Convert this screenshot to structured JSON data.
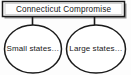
{
  "diagram": {
    "type": "concept-map",
    "background_color": "#fdfdfd",
    "stroke_color": "#1a1a1a",
    "shadow_color": "#9a9a9a",
    "fill_color": "#ffffff",
    "root": {
      "shape": "rectangle",
      "label": "Connecticut Compromise"
    },
    "children": [
      {
        "shape": "ellipse",
        "label": "Small states…",
        "position": "left"
      },
      {
        "shape": "ellipse",
        "label": "Large states…",
        "position": "right"
      }
    ],
    "connectors": [
      {
        "from": "root",
        "to": "left-ellipse",
        "style": "straight-vertical"
      },
      {
        "from": "root",
        "to": "right-ellipse",
        "style": "straight-vertical"
      }
    ]
  }
}
